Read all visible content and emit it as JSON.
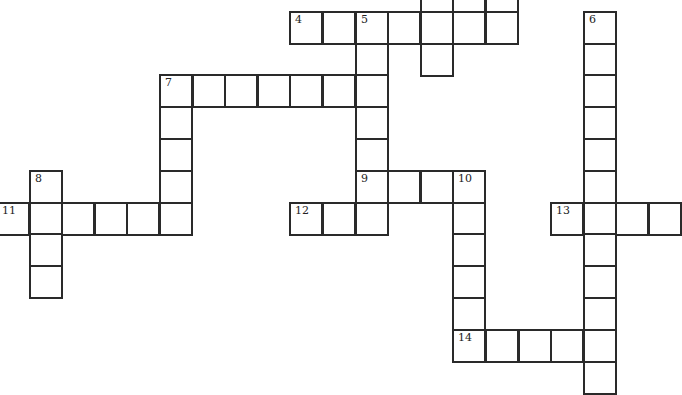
{
  "puzzle": {
    "type": "crossword",
    "cell_size": 33,
    "origin": {
      "x": -3,
      "y": -20
    },
    "col_step": 32.6,
    "row_step": 31.8,
    "cells": [
      {
        "r": 0,
        "c": 13
      },
      {
        "r": 0,
        "c": 14
      },
      {
        "r": 0,
        "c": 15
      },
      {
        "r": 1,
        "c": 9,
        "n": "4"
      },
      {
        "r": 1,
        "c": 10
      },
      {
        "r": 1,
        "c": 11,
        "n": "5"
      },
      {
        "r": 1,
        "c": 12
      },
      {
        "r": 1,
        "c": 13
      },
      {
        "r": 1,
        "c": 14
      },
      {
        "r": 1,
        "c": 15
      },
      {
        "r": 1,
        "c": 18,
        "n": "6"
      },
      {
        "r": 2,
        "c": 11
      },
      {
        "r": 2,
        "c": 13
      },
      {
        "r": 2,
        "c": 18
      },
      {
        "r": 3,
        "c": 5,
        "n": "7"
      },
      {
        "r": 3,
        "c": 6
      },
      {
        "r": 3,
        "c": 7
      },
      {
        "r": 3,
        "c": 8
      },
      {
        "r": 3,
        "c": 9
      },
      {
        "r": 3,
        "c": 10
      },
      {
        "r": 3,
        "c": 11
      },
      {
        "r": 3,
        "c": 18
      },
      {
        "r": 4,
        "c": 5
      },
      {
        "r": 4,
        "c": 11
      },
      {
        "r": 4,
        "c": 18
      },
      {
        "r": 5,
        "c": 5
      },
      {
        "r": 5,
        "c": 11
      },
      {
        "r": 5,
        "c": 18
      },
      {
        "r": 6,
        "c": 1,
        "n": "8"
      },
      {
        "r": 6,
        "c": 5
      },
      {
        "r": 6,
        "c": 11,
        "n": "9"
      },
      {
        "r": 6,
        "c": 12
      },
      {
        "r": 6,
        "c": 13
      },
      {
        "r": 6,
        "c": 14,
        "n": "10"
      },
      {
        "r": 6,
        "c": 18
      },
      {
        "r": 7,
        "c": 0,
        "n": "11"
      },
      {
        "r": 7,
        "c": 1
      },
      {
        "r": 7,
        "c": 2
      },
      {
        "r": 7,
        "c": 3
      },
      {
        "r": 7,
        "c": 4
      },
      {
        "r": 7,
        "c": 5
      },
      {
        "r": 7,
        "c": 9,
        "n": "12"
      },
      {
        "r": 7,
        "c": 10
      },
      {
        "r": 7,
        "c": 11
      },
      {
        "r": 7,
        "c": 14
      },
      {
        "r": 7,
        "c": 17,
        "n": "13"
      },
      {
        "r": 7,
        "c": 18
      },
      {
        "r": 7,
        "c": 19
      },
      {
        "r": 7,
        "c": 20
      },
      {
        "r": 8,
        "c": 1
      },
      {
        "r": 8,
        "c": 14
      },
      {
        "r": 8,
        "c": 18
      },
      {
        "r": 9,
        "c": 1
      },
      {
        "r": 9,
        "c": 14
      },
      {
        "r": 9,
        "c": 18
      },
      {
        "r": 10,
        "c": 14
      },
      {
        "r": 10,
        "c": 18
      },
      {
        "r": 11,
        "c": 14,
        "n": "14"
      },
      {
        "r": 11,
        "c": 15
      },
      {
        "r": 11,
        "c": 16
      },
      {
        "r": 11,
        "c": 17
      },
      {
        "r": 11,
        "c": 18
      },
      {
        "r": 12,
        "c": 18
      }
    ],
    "clue_numbers": [
      "4",
      "5",
      "6",
      "7",
      "8",
      "9",
      "10",
      "11",
      "12",
      "13",
      "14"
    ]
  }
}
